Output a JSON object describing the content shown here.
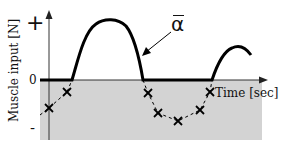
{
  "diagram": {
    "y_axis_label": "Muscle input [N]",
    "x_axis_label": "Time [sec]",
    "y_ticks": {
      "plus": "+",
      "zero": "0",
      "minus": "-"
    },
    "curve_label": "α",
    "curve_label_note": "alpha with overbar",
    "colors": {
      "negative_region": "#d3d3d3",
      "curve": "#000000",
      "axes": "#333333",
      "markers": "#000000"
    },
    "series": [
      {
        "name": "α̅ (solid curve, clipped at 0)",
        "style": "solid-thick"
      },
      {
        "name": "negative input (dashed with × markers)",
        "style": "dashed-x-markers",
        "points": [
          [
            49,
            108
          ],
          [
            67,
            92
          ],
          [
            148,
            93
          ],
          [
            158,
            113
          ],
          [
            178,
            121
          ],
          [
            200,
            110
          ],
          [
            210,
            92
          ]
        ]
      }
    ]
  }
}
